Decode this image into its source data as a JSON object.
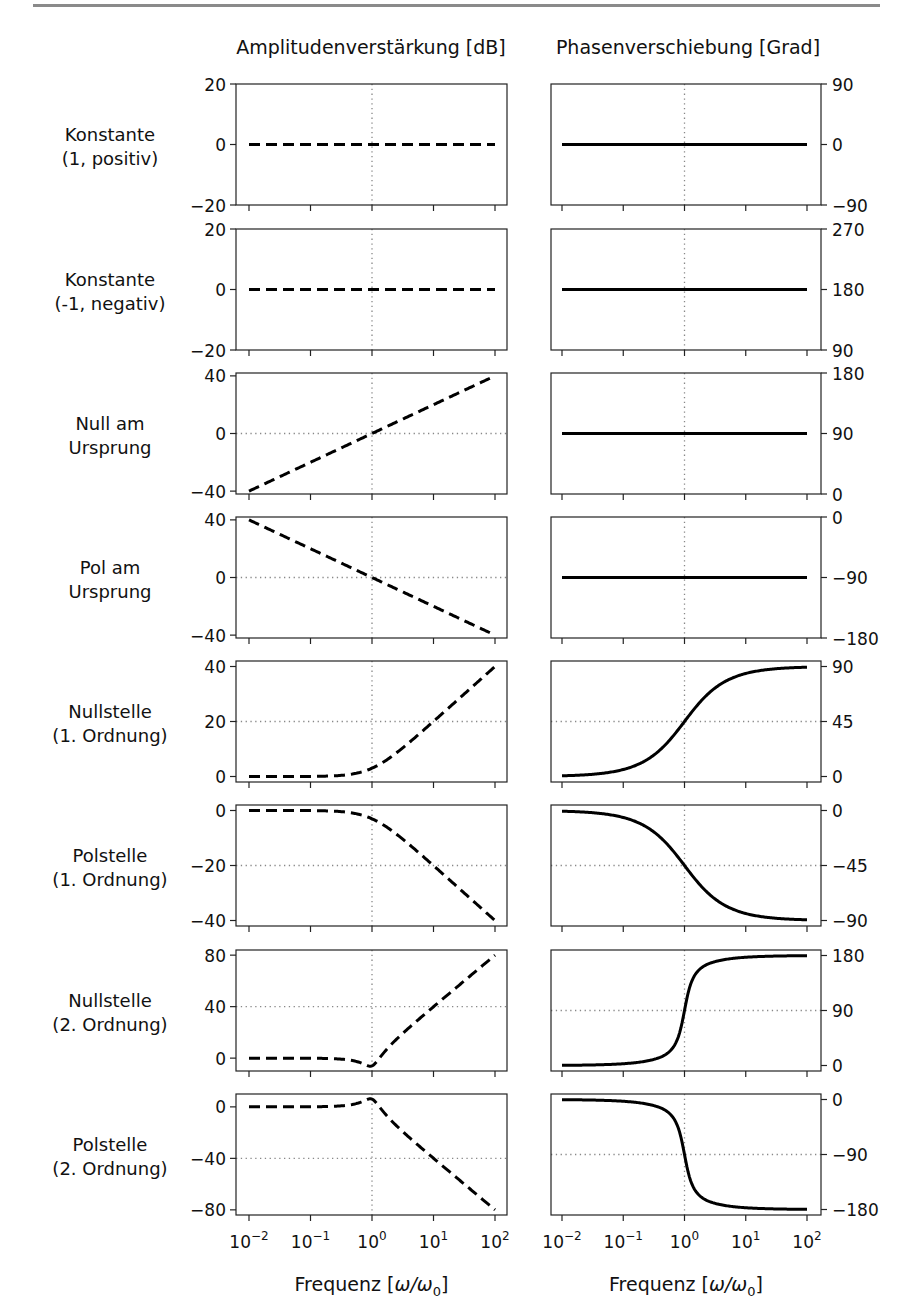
{
  "column_titles": {
    "amplitude": "Amplitudenverstärkung [dB]",
    "phase": "Phasenverschiebung [Grad]"
  },
  "x_axis": {
    "label": "Frequenz [ω/ω₀]",
    "label_main": "Frequenz [",
    "label_omega": "ω/ω",
    "label_sub": "0",
    "label_end": "]",
    "scale": "log",
    "range": [
      0.01,
      100
    ],
    "ticks": [
      {
        "base": "10",
        "exp": "−2"
      },
      {
        "base": "10",
        "exp": "−1"
      },
      {
        "base": "10",
        "exp": "0"
      },
      {
        "base": "10",
        "exp": "1"
      },
      {
        "base": "10",
        "exp": "2"
      }
    ]
  },
  "rows": [
    {
      "label": [
        "Konstante",
        "(1, positiv)"
      ]
    },
    {
      "label": [
        "Konstante",
        "(-1, negativ)"
      ]
    },
    {
      "label": [
        "Null am",
        "Ursprung"
      ]
    },
    {
      "label": [
        "Pol am",
        "Ursprung"
      ]
    },
    {
      "label": [
        "Nullstelle",
        "(1. Ordnung)"
      ]
    },
    {
      "label": [
        "Polstelle",
        "(1. Ordnung)"
      ]
    },
    {
      "label": [
        "Nullstelle",
        "(2. Ordnung)"
      ]
    },
    {
      "label": [
        "Polstelle",
        "(2. Ordnung)"
      ]
    }
  ],
  "chart_data": [
    {
      "type": "line",
      "title": "Amplitudenverstärkung [dB]",
      "xlabel": "Frequenz [ω/ω₀]",
      "ylabel": "Amplitudenverstärkung [dB]",
      "xscale": "log",
      "line_style": "dashed",
      "x": [
        0.01,
        0.1,
        1,
        10,
        100
      ],
      "panels": [
        {
          "row": "Konstante (1, positiv)",
          "ylim": [
            -20,
            20
          ],
          "yticks": [
            "20",
            "0",
            "−20"
          ],
          "ytick_values": [
            20,
            0,
            -20
          ],
          "hline": null,
          "kind": "const",
          "values": [
            0,
            0,
            0,
            0,
            0
          ]
        },
        {
          "row": "Konstante (-1, negativ)",
          "ylim": [
            -20,
            20
          ],
          "yticks": [
            "20",
            "0",
            "−20"
          ],
          "ytick_values": [
            20,
            0,
            -20
          ],
          "hline": null,
          "kind": "const",
          "values": [
            0,
            0,
            0,
            0,
            0
          ]
        },
        {
          "row": "Null am Ursprung",
          "ylim": [
            -42,
            42
          ],
          "yticks": [
            "40",
            "0",
            "−40"
          ],
          "ytick_values": [
            40,
            0,
            -40
          ],
          "hline": 0,
          "kind": "zero_origin",
          "values": [
            -40,
            -20,
            0,
            20,
            40
          ]
        },
        {
          "row": "Pol am Ursprung",
          "ylim": [
            -42,
            42
          ],
          "yticks": [
            "40",
            "0",
            "−40"
          ],
          "ytick_values": [
            40,
            0,
            -40
          ],
          "hline": 0,
          "kind": "pole_origin",
          "values": [
            40,
            20,
            0,
            -20,
            -40
          ]
        },
        {
          "row": "Nullstelle (1. Ordnung)",
          "ylim": [
            -2,
            42
          ],
          "yticks": [
            "40",
            "20",
            "0"
          ],
          "ytick_values": [
            40,
            20,
            0
          ],
          "hline": 20,
          "kind": "zero1",
          "values": [
            0,
            0.04,
            3,
            20,
            40
          ]
        },
        {
          "row": "Polstelle (1. Ordnung)",
          "ylim": [
            -42,
            2
          ],
          "yticks": [
            "0",
            "−20",
            "−40"
          ],
          "ytick_values": [
            0,
            -20,
            -40
          ],
          "hline": -20,
          "kind": "pole1",
          "values": [
            0,
            -0.04,
            -3,
            -20,
            -40
          ]
        },
        {
          "row": "Nullstelle (2. Ordnung)",
          "ylim": [
            -10,
            84
          ],
          "yticks": [
            "80",
            "40",
            "0"
          ],
          "ytick_values": [
            80,
            40,
            0
          ],
          "hline": 40,
          "kind": "zero2",
          "values": [
            0,
            -0.1,
            -6,
            40,
            80
          ]
        },
        {
          "row": "Polstelle (2. Ordnung)",
          "ylim": [
            -84,
            10
          ],
          "yticks": [
            "0",
            "−40",
            "−80"
          ],
          "ytick_values": [
            0,
            -40,
            -80
          ],
          "hline": -40,
          "kind": "pole2",
          "values": [
            0,
            0.1,
            6,
            -40,
            -80
          ]
        }
      ]
    },
    {
      "type": "line",
      "title": "Phasenverschiebung [Grad]",
      "xlabel": "Frequenz [ω/ω₀]",
      "ylabel": "Phasenverschiebung [Grad]",
      "xscale": "log",
      "line_style": "solid",
      "x": [
        0.01,
        0.1,
        1,
        10,
        100
      ],
      "panels": [
        {
          "row": "Konstante (1, positiv)",
          "ylim": [
            -90,
            90
          ],
          "yticks": [
            "90",
            "0",
            "−90"
          ],
          "ytick_values": [
            90,
            0,
            -90
          ],
          "hline": null,
          "kind": "const",
          "values": [
            0,
            0,
            0,
            0,
            0
          ]
        },
        {
          "row": "Konstante (-1, negativ)",
          "ylim": [
            90,
            270
          ],
          "yticks": [
            "270",
            "180",
            "90"
          ],
          "ytick_values": [
            270,
            180,
            90
          ],
          "hline": null,
          "kind": "const",
          "values": [
            180,
            180,
            180,
            180,
            180
          ]
        },
        {
          "row": "Null am Ursprung",
          "ylim": [
            0,
            180
          ],
          "yticks": [
            "180",
            "90",
            "0"
          ],
          "ytick_values": [
            180,
            90,
            0
          ],
          "hline": null,
          "kind": "const",
          "values": [
            90,
            90,
            90,
            90,
            90
          ]
        },
        {
          "row": "Pol am Ursprung",
          "ylim": [
            -180,
            0
          ],
          "yticks": [
            "0",
            "−90",
            "−180"
          ],
          "ytick_values": [
            0,
            -90,
            -180
          ],
          "hline": null,
          "kind": "const",
          "values": [
            -90,
            -90,
            -90,
            -90,
            -90
          ]
        },
        {
          "row": "Nullstelle (1. Ordnung)",
          "ylim": [
            -4.5,
            94.5
          ],
          "yticks": [
            "90",
            "45",
            "0"
          ],
          "ytick_values": [
            90,
            45,
            0
          ],
          "hline": 45,
          "kind": "zero1",
          "values": [
            0.6,
            5.7,
            45,
            84.3,
            89.4
          ]
        },
        {
          "row": "Polstelle (1. Ordnung)",
          "ylim": [
            -94.5,
            4.5
          ],
          "yticks": [
            "0",
            "−45",
            "−90"
          ],
          "ytick_values": [
            0,
            -45,
            -90
          ],
          "hline": -45,
          "kind": "pole1",
          "values": [
            -0.6,
            -5.7,
            -45,
            -84.3,
            -89.4
          ]
        },
        {
          "row": "Nullstelle (2. Ordnung)",
          "ylim": [
            -9,
            189
          ],
          "yticks": [
            "180",
            "90",
            "0"
          ],
          "ytick_values": [
            180,
            90,
            0
          ],
          "hline": 90,
          "kind": "zero2",
          "values": [
            0.4,
            3.5,
            90,
            176.5,
            179.6
          ]
        },
        {
          "row": "Polstelle (2. Ordnung)",
          "ylim": [
            -189,
            9
          ],
          "yticks": [
            "0",
            "−90",
            "−180"
          ],
          "ytick_values": [
            0,
            -90,
            -180
          ],
          "hline": -90,
          "kind": "pole2",
          "values": [
            -0.4,
            -3.5,
            -90,
            -176.5,
            -179.6
          ]
        }
      ]
    }
  ]
}
